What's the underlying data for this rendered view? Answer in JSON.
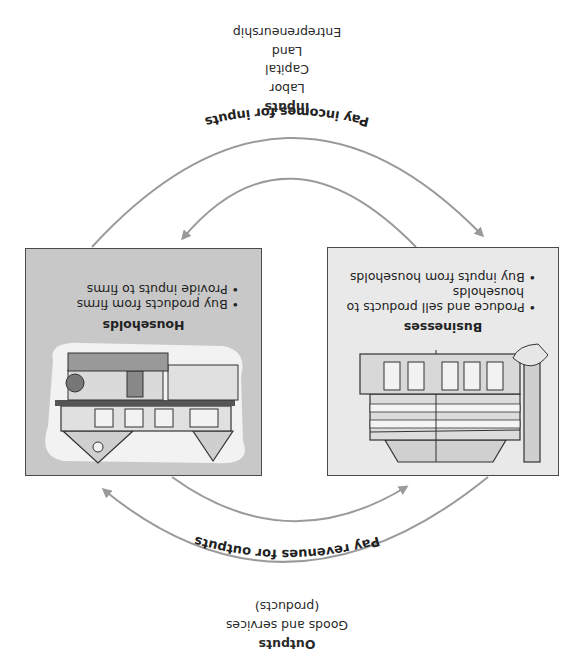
{
  "diagram": {
    "orientation": "rotated-180",
    "outputs": {
      "heading": "Outputs",
      "line1": "Goods and services",
      "line2": "(products)"
    },
    "inputs": {
      "heading": "Inputs",
      "items": [
        "Labor",
        "Capital",
        "Land",
        "Entrepreneurship"
      ]
    },
    "businesses": {
      "title": "Businesses",
      "bullets": [
        "Produce and sell products to households",
        "Buy inputs from households"
      ],
      "bg_color": "#e9e9e9"
    },
    "households": {
      "title": "Households",
      "bullets": [
        "Buy products from firms",
        "Provide inputs to firms"
      ],
      "bg_color": "#c8c8c8"
    },
    "flows": {
      "revenues": "Pay revenues for outputs",
      "incomes": "Pay incomes for inputs"
    },
    "arrow_color": "#9a9a9a"
  }
}
